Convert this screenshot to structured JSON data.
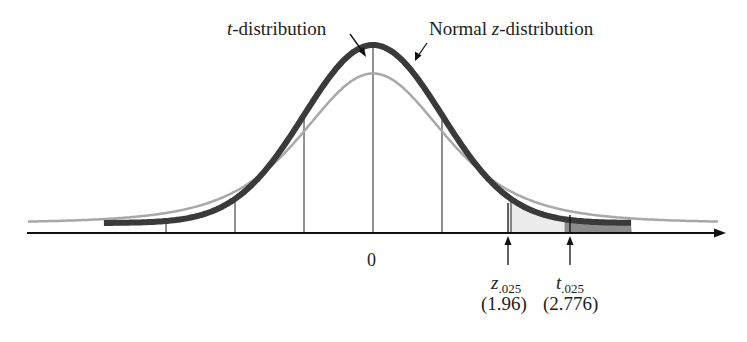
{
  "chart_data": {
    "type": "line",
    "title": "",
    "xlabel": "",
    "ylabel": "",
    "grid": false,
    "legend": "annotations",
    "x_center_label": "0",
    "series": [
      {
        "name": "t-distribution",
        "style": "thin gray",
        "color": "#a8a8a8",
        "df": 4,
        "peak_relative": 0.84,
        "heavier_tails": true
      },
      {
        "name": "Normal z-distribution",
        "style": "thick dark",
        "color": "#3a3a3a",
        "peak_relative": 1.0
      }
    ],
    "reference_lines_sd": [
      -3,
      -2,
      -1,
      0,
      1,
      2
    ],
    "critical_values": [
      {
        "name": "z.025",
        "value": 1.96
      },
      {
        "name": "t.025",
        "value": 2.776
      }
    ],
    "shaded_regions": [
      {
        "from": 1.96,
        "to": 2.776,
        "fill": "#ececec",
        "meaning": "z upper tail area (0.025)"
      },
      {
        "from": 2.776,
        "to": 3.75,
        "fill": "#8c8c8c",
        "meaning": "t upper tail area beyond t.025"
      }
    ]
  },
  "labels": {
    "t_dist_prefix": "t",
    "t_dist_suffix": "-distribution",
    "normal_prefix": "Normal ",
    "normal_var": "z",
    "normal_suffix": "-distribution",
    "zero": "0",
    "z_sym": "z",
    "z_sub": ".025",
    "z_val": "(1.96)",
    "t_sym": "t",
    "t_sub": ".025",
    "t_val": "(2.776)"
  },
  "colors": {
    "normal_curve": "#3a3a3a",
    "t_curve": "#a8a8a8",
    "axis": "#111111",
    "light_fill": "#ececec",
    "dark_fill": "#8c8c8c"
  }
}
